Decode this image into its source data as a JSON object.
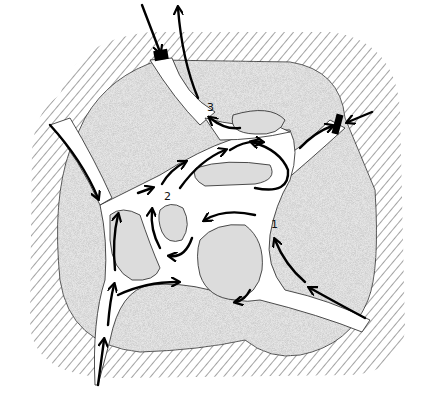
{
  "diagram": {
    "type": "flow-network",
    "colors": {
      "background": "#ffffff",
      "hatch": "#555555",
      "stipple_fill": "#d9d9d9",
      "outline": "#222222",
      "arrow": "#000000",
      "channel": "#ffffff"
    },
    "labels": [
      {
        "id": "point-1",
        "text": "1",
        "x": 271,
        "y": 228
      },
      {
        "id": "point-2",
        "text": "2",
        "x": 164,
        "y": 200
      },
      {
        "id": "point-3",
        "text": "3",
        "x": 207,
        "y": 111
      }
    ],
    "openings": [
      {
        "id": "top-opening",
        "x": 160,
        "y": 58,
        "arrows": [
          "in",
          "out"
        ]
      },
      {
        "id": "right-opening",
        "x": 339,
        "y": 124,
        "arrows": [
          "in"
        ]
      }
    ],
    "entries": [
      {
        "id": "left-entry",
        "from": [
          50,
          125
        ],
        "direction": "in"
      },
      {
        "id": "bottom-entry",
        "from": [
          98,
          385
        ],
        "direction": "in"
      },
      {
        "id": "lower-right-entry",
        "from": [
          368,
          315
        ],
        "direction": "in"
      }
    ]
  }
}
